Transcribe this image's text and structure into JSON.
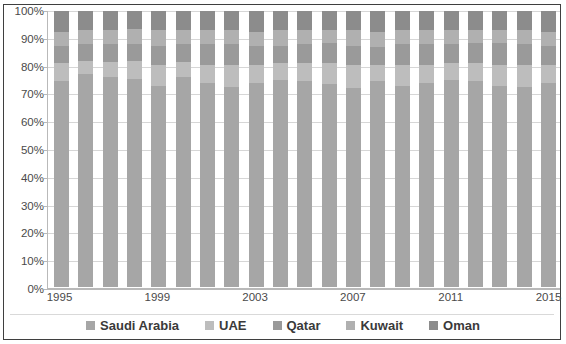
{
  "chart_data": {
    "type": "bar",
    "subtype": "100% stacked column",
    "title": "",
    "subtitle": "",
    "xlabel": "",
    "ylabel": "",
    "ylim": [
      0,
      100
    ],
    "y_tick_labels": [
      "0%",
      "10%",
      "20%",
      "30%",
      "40%",
      "50%",
      "60%",
      "70%",
      "80%",
      "90%",
      "100%"
    ],
    "y_ticks": [
      0,
      10,
      20,
      30,
      40,
      50,
      60,
      70,
      80,
      90,
      100
    ],
    "grid": true,
    "legend_position": "bottom",
    "categories": [
      "1995",
      "1996",
      "1997",
      "1998",
      "1999",
      "2000",
      "2001",
      "2002",
      "2003",
      "2004",
      "2005",
      "2006",
      "2007",
      "2008",
      "2009",
      "2010",
      "2011",
      "2012",
      "2013",
      "2014",
      "2015"
    ],
    "x_tick_labels_shown": [
      "1995",
      "1999",
      "2003",
      "2007",
      "2011",
      "2015"
    ],
    "series": [
      {
        "name": "Saudi Arabia",
        "color": "#a6a6a6",
        "values": [
          74.5,
          77.0,
          76.0,
          75.5,
          73.0,
          76.0,
          74.0,
          72.5,
          74.0,
          75.0,
          74.5,
          73.5,
          72.0,
          74.5,
          73.0,
          74.0,
          75.0,
          74.5,
          73.0,
          72.5,
          74.0
        ]
      },
      {
        "name": "UAE",
        "color": "#bdbdbd",
        "values": [
          6.5,
          5.0,
          5.5,
          6.5,
          7.5,
          5.5,
          6.5,
          8.0,
          6.5,
          6.0,
          6.5,
          7.5,
          8.5,
          6.0,
          7.5,
          6.5,
          6.0,
          6.5,
          7.5,
          8.0,
          6.5
        ]
      },
      {
        "name": "Qatar",
        "color": "#9a9a9a",
        "values": [
          6.5,
          6.0,
          6.5,
          6.0,
          7.0,
          6.5,
          7.5,
          7.5,
          7.0,
          6.5,
          7.0,
          7.5,
          7.0,
          6.5,
          7.5,
          7.5,
          7.0,
          7.5,
          8.0,
          7.5,
          7.0
        ]
      },
      {
        "name": "Kuwait",
        "color": "#b0b0b0",
        "values": [
          5.0,
          5.0,
          5.0,
          5.5,
          5.5,
          5.0,
          5.0,
          5.0,
          5.0,
          5.5,
          5.0,
          4.5,
          5.5,
          5.5,
          5.0,
          5.0,
          5.0,
          4.5,
          4.5,
          5.0,
          5.0
        ]
      },
      {
        "name": "Oman",
        "color": "#8c8c8c",
        "values": [
          7.5,
          7.0,
          7.0,
          6.5,
          7.0,
          7.0,
          7.0,
          7.0,
          7.5,
          7.0,
          7.0,
          7.0,
          7.0,
          7.5,
          7.0,
          7.0,
          7.0,
          7.0,
          7.0,
          7.0,
          7.5
        ]
      }
    ]
  },
  "legend": {
    "items": [
      {
        "label": "Saudi Arabia",
        "color": "#a6a6a6"
      },
      {
        "label": "UAE",
        "color": "#bdbdbd"
      },
      {
        "label": "Qatar",
        "color": "#9a9a9a"
      },
      {
        "label": "Kuwait",
        "color": "#b0b0b0"
      },
      {
        "label": "Oman",
        "color": "#8c8c8c"
      }
    ]
  }
}
